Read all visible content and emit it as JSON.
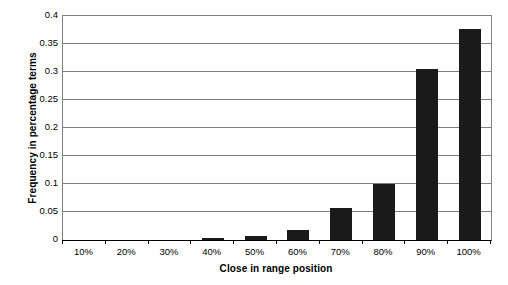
{
  "chart_data": {
    "type": "bar",
    "title": "",
    "subtitle": "",
    "xlabel": "Close in range position",
    "ylabel": "Frequency in percentage terms",
    "categories": [
      "10%",
      "20%",
      "30%",
      "40%",
      "50%",
      "60%",
      "70%",
      "80%",
      "90%",
      "100%"
    ],
    "values": [
      0,
      0,
      0,
      0.004,
      0.008,
      0.018,
      0.057,
      0.1,
      0.306,
      0.377
    ],
    "series": [
      {
        "name": "Frequency",
        "values": [
          0,
          0,
          0,
          0.004,
          0.008,
          0.018,
          0.057,
          0.1,
          0.306,
          0.377
        ]
      }
    ],
    "ylim": [
      0,
      0.4
    ],
    "ytick_labels": [
      "0",
      "0.05",
      "0.1",
      "0.15",
      "0.2",
      "0.25",
      "0.3",
      "0.35",
      "0.4"
    ],
    "ytick_values": [
      0,
      0.05,
      0.1,
      0.15,
      0.2,
      0.25,
      0.3,
      0.35,
      0.4
    ],
    "grid": "horizontal",
    "legend": "none",
    "bar_color": "#1a1a1a",
    "gridline_color": "#808080",
    "axis_color": "#000000",
    "background_color": "#ffffff",
    "plot_background_color": "#ffffff"
  }
}
